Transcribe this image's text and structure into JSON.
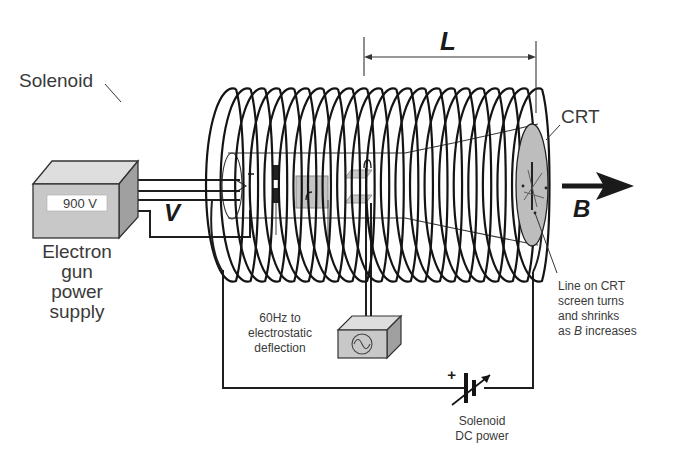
{
  "diagram": {
    "title_implied": "Solenoid focusing of an electron beam in a CRT",
    "labels": {
      "solenoid": "Solenoid",
      "length": "L",
      "crt": "CRT",
      "field": "B",
      "voltage_symbol": "V",
      "power_supply_display": "900 V",
      "power_supply_line1": "Electron",
      "power_supply_line2": "gun",
      "power_supply_line3": "power",
      "power_supply_line4": "supply",
      "oscillator_line1": "60Hz to",
      "oscillator_line2": "electrostatic",
      "oscillator_line3": "deflection",
      "screen_note_line1": "Line on CRT",
      "screen_note_line2": "screen turns",
      "screen_note_line3": "and shrinks",
      "screen_note_line4_prefix": "as ",
      "screen_note_line4_symbol": "B",
      "screen_note_line4_suffix": " increases",
      "dc_power_line1": "Solenoid",
      "dc_power_line2": "DC power",
      "polarity": "+"
    },
    "components": [
      {
        "id": "electron-gun-power-supply",
        "display": "900 V"
      },
      {
        "id": "solenoid-coil",
        "turns_visible": 22
      },
      {
        "id": "crt-tube"
      },
      {
        "id": "ac-oscillator-60hz",
        "symbol": "sine-wave"
      },
      {
        "id": "variable-dc-battery"
      },
      {
        "id": "magnetic-field-arrow",
        "label": "B"
      }
    ],
    "colors": {
      "line": "#141414",
      "box_fill": "#c8c8c8",
      "box_side": "#a0a0a0",
      "box_top": "#dedede",
      "screen_fill": "#bcbcbc",
      "text": "#3a3a3a"
    }
  }
}
